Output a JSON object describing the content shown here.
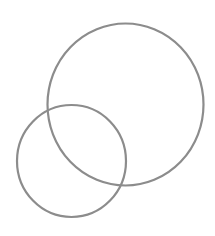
{
  "diagram": {
    "type": "overlapping-circles",
    "background": "#ffffff",
    "stroke_color": "#8c8c8c",
    "stroke_width": 2.2,
    "shapes": [
      {
        "name": "large-circle",
        "cx": 125.5,
        "cy": 104.5,
        "rx": 78,
        "ry": 81
      },
      {
        "name": "small-circle",
        "cx": 71.5,
        "cy": 161,
        "rx": 54.5,
        "ry": 56
      }
    ]
  }
}
